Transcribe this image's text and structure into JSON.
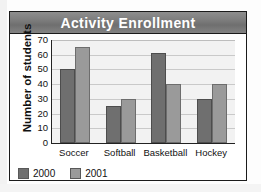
{
  "chart_data": {
    "type": "bar",
    "title": "Activity Enrollment",
    "xlabel": "",
    "ylabel": "Number of students",
    "categories": [
      "Soccer",
      "Softball",
      "Basketball",
      "Hockey"
    ],
    "series": [
      {
        "name": "2000",
        "color": "#6f6f6f",
        "values": [
          50,
          25,
          61,
          30
        ]
      },
      {
        "name": "2001",
        "color": "#9a9a9a",
        "values": [
          65,
          30,
          40,
          40
        ]
      }
    ],
    "ylim": [
      0,
      70
    ],
    "yticks": [
      70,
      60,
      50,
      40,
      30,
      20,
      10,
      0
    ],
    "grid": true,
    "legend_position": "bottom-left"
  },
  "legend": {
    "items": [
      {
        "label": "2000",
        "swatch": "legend-swatch-2000"
      },
      {
        "label": "2001",
        "swatch": "legend-swatch-2001"
      }
    ]
  },
  "colors": {
    "series_2000": "#6f6f6f",
    "series_2001": "#9a9a9a",
    "title_band": "#7d7d7d",
    "plot_background": "#f2f2f2",
    "frame_border": "#1b1b1b"
  }
}
